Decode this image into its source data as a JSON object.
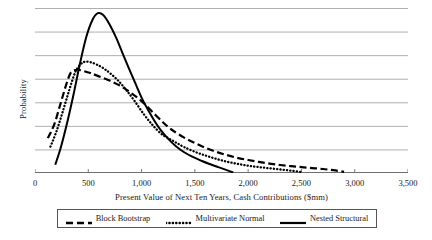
{
  "chart_data": {
    "type": "line",
    "title": "",
    "xlabel": "Present Value of Next Ten Years, Cash Contributions ($mm)",
    "ylabel": "Probability",
    "xlim": [
      0,
      3500
    ],
    "ylim": [
      0,
      7
    ],
    "grid": true,
    "grid_lines": 8,
    "legend_position": "bottom",
    "xticks": [
      0,
      500,
      1000,
      1500,
      2000,
      2500,
      3000,
      3500
    ],
    "xtick_labels": [
      "0",
      "500",
      "1,000",
      "1,500",
      "2,000",
      "2,500",
      "3,000",
      "3,500"
    ],
    "yticks": [],
    "ytick_labels": [],
    "series": [
      {
        "name": "Block Bootstrap",
        "style": "dashed",
        "color": "#000000",
        "x": [
          120,
          180,
          240,
          300,
          340,
          400,
          460,
          520,
          600,
          700,
          800,
          900,
          1000,
          1100,
          1200,
          1250,
          1300,
          1400,
          1500,
          1600,
          1700,
          1800,
          1900,
          2000,
          2100,
          2200,
          2300,
          2400,
          2500,
          2600,
          2700,
          2800,
          2900
        ],
        "y": [
          1.48,
          2.05,
          2.95,
          3.85,
          4.28,
          4.38,
          4.32,
          4.24,
          4.1,
          3.92,
          3.7,
          3.4,
          3.05,
          2.6,
          2.15,
          1.95,
          1.78,
          1.5,
          1.27,
          1.07,
          0.9,
          0.76,
          0.64,
          0.55,
          0.47,
          0.4,
          0.34,
          0.29,
          0.25,
          0.21,
          0.17,
          0.12,
          0.05
        ]
      },
      {
        "name": "Multivariate Normal",
        "style": "dotted",
        "color": "#000000",
        "x": [
          145,
          200,
          260,
          320,
          380,
          430,
          470,
          520,
          580,
          640,
          700,
          780,
          860,
          940,
          1020,
          1100,
          1180,
          1250,
          1320,
          1400,
          1500,
          1600,
          1700,
          1800,
          1900,
          2000,
          2100,
          2200,
          2300,
          2400,
          2500
        ],
        "y": [
          1.12,
          1.75,
          2.6,
          3.5,
          4.3,
          4.62,
          4.72,
          4.7,
          4.6,
          4.45,
          4.25,
          3.92,
          3.5,
          3.02,
          2.5,
          2.05,
          1.68,
          1.48,
          1.3,
          1.1,
          0.9,
          0.74,
          0.6,
          0.48,
          0.39,
          0.31,
          0.25,
          0.2,
          0.15,
          0.1,
          0.04
        ]
      },
      {
        "name": "Nested Structural",
        "style": "solid",
        "color": "#000000",
        "x": [
          190,
          240,
          300,
          360,
          420,
          480,
          540,
          590,
          640,
          700,
          760,
          820,
          880,
          940,
          1000,
          1060,
          1120,
          1180,
          1250,
          1320,
          1400,
          1480,
          1560,
          1640,
          1720,
          1800,
          1860
        ],
        "y": [
          0.35,
          1.05,
          2.1,
          3.3,
          4.6,
          5.75,
          6.5,
          6.78,
          6.7,
          6.3,
          5.75,
          5.1,
          4.45,
          3.82,
          3.2,
          2.68,
          2.22,
          1.82,
          1.45,
          1.15,
          0.88,
          0.68,
          0.52,
          0.38,
          0.25,
          0.12,
          0.02
        ]
      }
    ]
  },
  "legend": {
    "entries": [
      {
        "label": "Block Bootstrap",
        "style": "dashed"
      },
      {
        "label": "Multivariate Normal",
        "style": "dotted"
      },
      {
        "label": "Nested Structural",
        "style": "solid"
      }
    ]
  },
  "axes": {
    "x_title": "Present Value of Next Ten Years, Cash Contributions ($mm)",
    "y_title": "Probability"
  },
  "colors": {
    "line": "#000000",
    "grid": "#9a9a9a",
    "axis": "#6f6f6f",
    "legend_border": "#555555",
    "background": "#ffffff"
  }
}
